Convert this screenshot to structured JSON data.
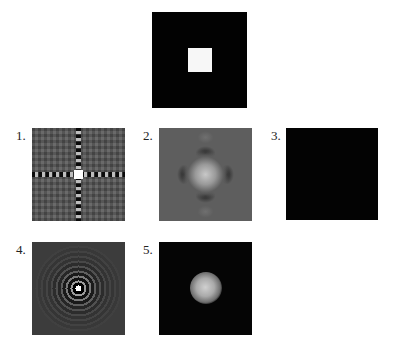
{
  "figure": {
    "source_image": {
      "description": "black square with small white square aperture in center",
      "background_color": "#020202",
      "aperture_color": "#f7f7f7"
    },
    "panels": [
      {
        "label": "1.",
        "description": "sinc-like cross pattern (Fourier transform of square)"
      },
      {
        "label": "2.",
        "description": "blurred central blob with dark side lobes"
      },
      {
        "label": "3.",
        "description": "uniform black image"
      },
      {
        "label": "4.",
        "description": "concentric ring pattern (Airy-like)"
      },
      {
        "label": "5.",
        "description": "soft bright disk on black background"
      }
    ]
  }
}
